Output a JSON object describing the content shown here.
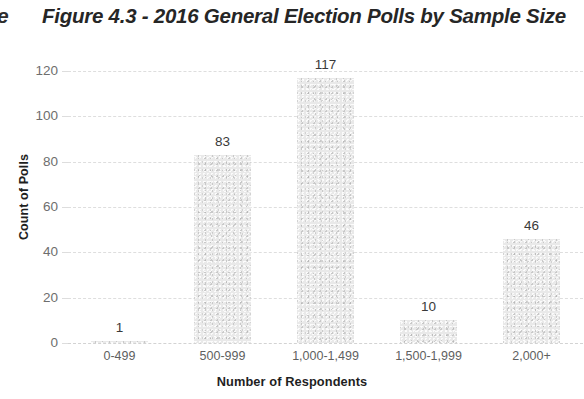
{
  "page": {
    "edge_glyph": "e"
  },
  "chart_data": {
    "type": "bar",
    "title": "Figure 4.3 - 2016 General Election Polls by Sample Size",
    "xlabel": "Number of Respondents",
    "ylabel": "Count of Polls",
    "categories": [
      "0-499",
      "500-999",
      "1,000-1,499",
      "1,500-1,999",
      "2,000+"
    ],
    "values": [
      1,
      83,
      117,
      10,
      46
    ],
    "data_labels": [
      "1",
      "83",
      "117",
      "10",
      "46"
    ],
    "ylim": [
      0,
      120
    ],
    "yticks": [
      0,
      20,
      40,
      60,
      80,
      100,
      120
    ],
    "ytick_labels": [
      "0",
      "20",
      "40",
      "60",
      "80",
      "100",
      "120"
    ],
    "grid": true,
    "grid_axis": "y",
    "legend": false,
    "bar_color": "#e9e9e9",
    "text_color": "#3a3a3a",
    "gridline_color": "#d9d9d9"
  }
}
